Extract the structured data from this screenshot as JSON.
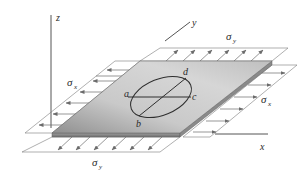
{
  "figure": {
    "axes": {
      "x_label": "x",
      "y_label": "y",
      "z_label": "z"
    },
    "stress_labels": {
      "sigma": "σ",
      "x_sub": "x",
      "y_sub": "y"
    },
    "points": {
      "a": "a",
      "b": "b",
      "c": "c",
      "d": "d"
    },
    "colors": {
      "plate_light": "#e6e6e6",
      "plate_mid": "#bdbdbd",
      "plate_dark": "#8c8c8c",
      "edge": "#6a6a6a",
      "lines": "#7a7a7a",
      "text": "#2a2a2a"
    }
  }
}
